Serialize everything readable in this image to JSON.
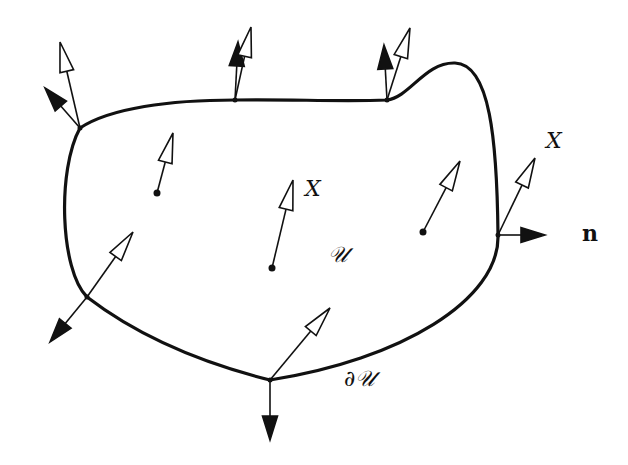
{
  "diagram": {
    "type": "vector-field-on-region",
    "colors": {
      "ink": "#111111",
      "background": "#ffffff"
    },
    "labels": {
      "field_interior": "X",
      "field_boundary": "X",
      "normal": "n",
      "region": "𝒰",
      "boundary": "∂𝒰"
    },
    "region": {
      "name": "U",
      "boundary_path": "M80,128 C110,108 170,100 235,100 C290,99 340,102 387,100 C410,97 425,62 455,63 C490,64 497,140 498,235 C500,300 400,360 270,380 C190,360 130,330 87,297 C60,270 57,170 80,128 Z"
    },
    "interior_vectors": [
      {
        "base": [
          157,
          193
        ],
        "tip": [
          173,
          133
        ]
      },
      {
        "base": [
          272,
          268
        ],
        "tip": [
          293,
          180
        ]
      },
      {
        "base": [
          423,
          232
        ],
        "tip": [
          460,
          161
        ]
      }
    ],
    "boundary_points": [
      {
        "point": [
          80,
          128
        ],
        "field_tip": [
          60,
          42
        ],
        "normal_tip": [
          45,
          88
        ]
      },
      {
        "point": [
          235,
          100
        ],
        "field_tip": [
          251,
          27
        ],
        "normal_tip": [
          238,
          42
        ]
      },
      {
        "point": [
          387,
          100
        ],
        "field_tip": [
          410,
          28
        ],
        "normal_tip": [
          384,
          45
        ]
      },
      {
        "point": [
          498,
          235
        ],
        "field_tip": [
          535,
          158
        ],
        "normal_tip": [
          545,
          235
        ]
      },
      {
        "point": [
          87,
          297
        ],
        "field_tip": [
          133,
          232
        ],
        "normal_tip": [
          50,
          342
        ]
      },
      {
        "point": [
          270,
          380
        ],
        "field_tip": [
          330,
          308
        ],
        "normal_tip": [
          270,
          440
        ]
      }
    ]
  }
}
